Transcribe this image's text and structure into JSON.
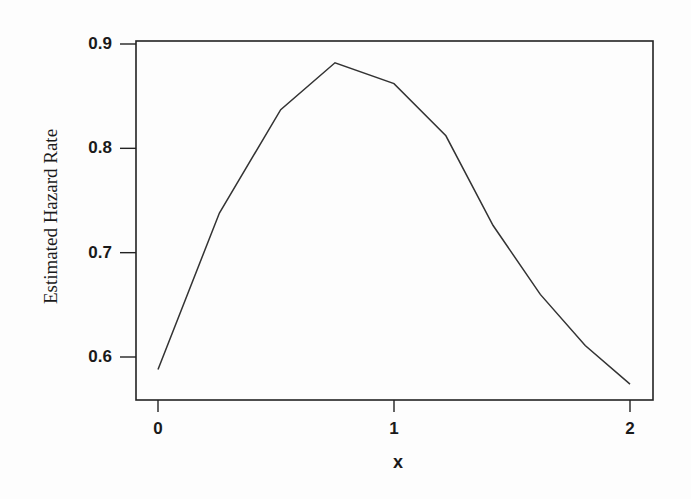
{
  "chart_data": {
    "type": "line",
    "title": "",
    "xlabel": "x",
    "ylabel": "Estimated Hazard Rate",
    "xlim": [
      -0.09,
      2.09
    ],
    "ylim": [
      0.556,
      0.903
    ],
    "grid": false,
    "legend": null,
    "x_ticks": [
      0,
      1,
      2
    ],
    "x_tick_labels": [
      "0",
      "1",
      "2"
    ],
    "y_ticks": [
      0.6,
      0.7,
      0.8,
      0.9
    ],
    "y_tick_labels": [
      "0.6",
      "0.7",
      "0.8",
      "0.9"
    ],
    "series": [
      {
        "name": "Estimated Hazard Rate",
        "color": "#333333",
        "x": [
          0.0,
          0.26,
          0.52,
          0.75,
          1.0,
          1.22,
          1.42,
          1.62,
          1.81,
          2.0
        ],
        "y": [
          0.588,
          0.738,
          0.837,
          0.882,
          0.862,
          0.812,
          0.726,
          0.66,
          0.611,
          0.574
        ]
      }
    ]
  },
  "colors": {
    "axis": "#222222",
    "line": "#333333",
    "background": "#fdfdfd"
  }
}
